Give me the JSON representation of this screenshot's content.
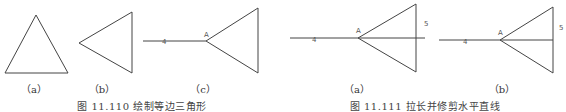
{
  "figures": [
    {
      "caption": "图 11.110  绘制等边三角形",
      "panels": [
        {
          "label": "（a）"
        },
        {
          "label": "（b）"
        },
        {
          "label": "（c）",
          "point_labels": {
            "line": "4",
            "vertex": "A"
          }
        }
      ]
    },
    {
      "caption": "图 11.111  拉长并修剪水平直线",
      "panels": [
        {
          "label": "（a）",
          "point_labels": {
            "line": "4",
            "vertex": "A",
            "side": "5"
          }
        },
        {
          "label": "（b）",
          "point_labels": {
            "line": "4",
            "vertex": "A",
            "side": "5"
          }
        }
      ]
    }
  ],
  "colors": {
    "stroke": "#444444",
    "text": "#333333"
  }
}
